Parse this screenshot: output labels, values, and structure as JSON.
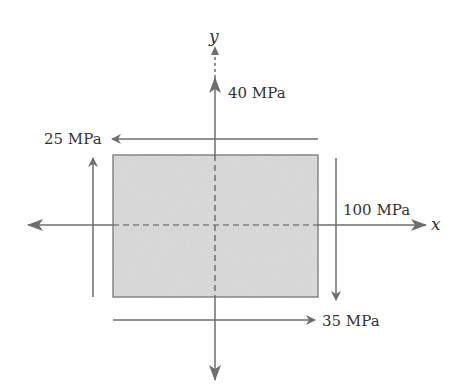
{
  "diagram": {
    "type": "plane-stress-element",
    "axes": {
      "x_label": "x",
      "y_label": "y"
    },
    "element": {
      "fill": "#d9d9d9",
      "stroke": "#6a6a6a"
    },
    "stresses": {
      "normal_y": "40 MPa",
      "shear_top": "25 MPa",
      "normal_x": "100 MPa",
      "shear_bottom": "35 MPa"
    },
    "colors": {
      "arrow": "#6e6e6e",
      "text": "#333333"
    }
  }
}
